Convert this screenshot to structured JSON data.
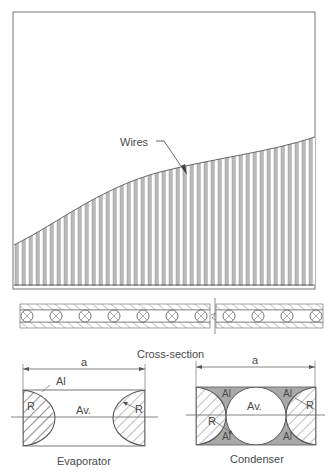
{
  "figure": {
    "top_panel": {
      "callout_label": "Wires"
    },
    "cross_section": {
      "caption": "Cross-section",
      "tube_count_left": 7,
      "tube_count_right": 4
    },
    "evaporator": {
      "caption": "Evaporator",
      "dimension_label": "a",
      "labels": {
        "al": "Al",
        "av": "Av.",
        "r_left": "R",
        "r_right": "R"
      }
    },
    "condenser": {
      "caption": "Condenser",
      "dimension_label": "a",
      "labels": {
        "al_top_left": "Al",
        "al_top_right": "Al",
        "al_bottom_left": "Al",
        "al_bottom_right": "Al",
        "av": "Av.",
        "r_left": "R",
        "r_right": "R"
      }
    },
    "colors": {
      "line": "#555555",
      "wire_fill": "#b9b9b9",
      "aluminium_fill": "#a9a9a9",
      "hatch": "#6e6e6e"
    }
  }
}
